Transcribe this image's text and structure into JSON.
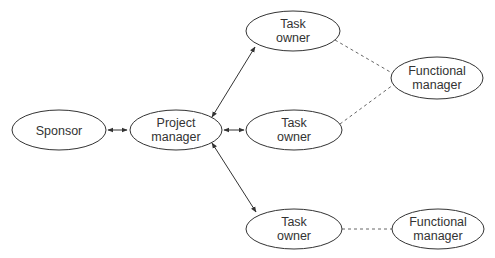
{
  "diagram": {
    "type": "organization-relationship",
    "nodes": [
      {
        "id": "sponsor",
        "lines": [
          "Sponsor"
        ],
        "cx": 59,
        "cy": 130,
        "rx": 47,
        "ry": 20
      },
      {
        "id": "project-manager",
        "lines": [
          "Project",
          "manager"
        ],
        "cx": 176,
        "cy": 130,
        "rx": 46,
        "ry": 20
      },
      {
        "id": "task-owner-1",
        "lines": [
          "Task",
          "owner"
        ],
        "cx": 293,
        "cy": 31,
        "rx": 47,
        "ry": 20
      },
      {
        "id": "task-owner-2",
        "lines": [
          "Task",
          "owner"
        ],
        "cx": 294,
        "cy": 130,
        "rx": 48,
        "ry": 20
      },
      {
        "id": "task-owner-3",
        "lines": [
          "Task",
          "owner"
        ],
        "cx": 294,
        "cy": 229,
        "rx": 48,
        "ry": 20
      },
      {
        "id": "functional-manager-1",
        "lines": [
          "Functional",
          "manager"
        ],
        "cx": 437,
        "cy": 78,
        "rx": 46,
        "ry": 21
      },
      {
        "id": "functional-manager-2",
        "lines": [
          "Functional",
          "manager"
        ],
        "cx": 438,
        "cy": 229,
        "rx": 46,
        "ry": 20
      }
    ],
    "edges": [
      {
        "from": "sponsor",
        "to": "project-manager",
        "style": "solid",
        "arrows": "both"
      },
      {
        "from": "project-manager",
        "to": "task-owner-1",
        "style": "solid",
        "arrows": "both"
      },
      {
        "from": "project-manager",
        "to": "task-owner-2",
        "style": "solid",
        "arrows": "both"
      },
      {
        "from": "project-manager",
        "to": "task-owner-3",
        "style": "solid",
        "arrows": "both"
      },
      {
        "from": "task-owner-1",
        "to": "functional-manager-1",
        "style": "dashed",
        "arrows": "none"
      },
      {
        "from": "task-owner-2",
        "to": "functional-manager-1",
        "style": "dashed",
        "arrows": "none"
      },
      {
        "from": "task-owner-3",
        "to": "functional-manager-2",
        "style": "dashed",
        "arrows": "none"
      }
    ]
  },
  "labels": {
    "sponsor": "Sponsor",
    "project_manager_1": "Project",
    "project_manager_2": "manager",
    "task_owner_1": "Task",
    "task_owner_2": "owner",
    "functional_manager_1": "Functional",
    "functional_manager_2": "manager"
  }
}
